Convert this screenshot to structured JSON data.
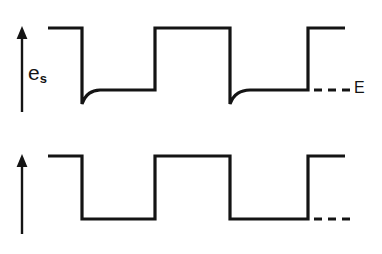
{
  "figure": {
    "type": "waveform-diagram",
    "width": 382,
    "height": 254,
    "background_color": "#ffffff",
    "stroke_color": "#141414"
  },
  "panels": [
    {
      "id": "top",
      "signal_name": "e_s",
      "label_base": "e",
      "label_subscript": "s",
      "label_style": "upright",
      "reference_label": "E",
      "reference_dash_style": "dashed",
      "waveform_kind": "ac-coupled-square-with-exponential-recovery",
      "notes": "Square wave whose falling edges undershoot below the E reference level and then recover exponentially back toward E"
    },
    {
      "id": "bottom",
      "signal_name": "v_0",
      "label_base": "ᴠ",
      "label_subscript": "0",
      "label_style": "script-italic",
      "reference_label": "E",
      "reference_dash_style": "dashed",
      "waveform_kind": "ideal-square-wave",
      "notes": "Clean rectangular square wave with flat high and low levels"
    }
  ],
  "chart_data": {
    "type": "line",
    "title": "",
    "xlabel": "",
    "ylabel": "",
    "grid": false,
    "legend": false,
    "xlim": [
      0,
      382
    ],
    "series": [
      {
        "name": "e_s",
        "panel": "top",
        "ylabel": "e_s",
        "high_level": 28,
        "low_level": 90,
        "undershoot_level": 104,
        "reference_level_E": 90,
        "path": "M 48 28 L 82 28 L 82 104 C 86 93 92 90.5 100 90 L 155 90 L 155 28 L 230 28 L 230 104 C 234 93 241 90.5 250 90 L 308 90 L 308 28 L 345 28",
        "transitions": [
          {
            "x": 82,
            "type": "fall"
          },
          {
            "x": 155,
            "type": "rise"
          },
          {
            "x": 230,
            "type": "fall"
          },
          {
            "x": 308,
            "type": "rise"
          }
        ],
        "reference_dashes": [
          {
            "x1": 314,
            "x2": 322,
            "y": 90
          },
          {
            "x1": 328,
            "x2": 336,
            "y": 90
          },
          {
            "x1": 342,
            "x2": 350,
            "y": 90
          }
        ],
        "axis_arrow": {
          "x": 22,
          "y_top": 26,
          "y_bottom": 112
        }
      },
      {
        "name": "v_0",
        "panel": "bottom",
        "ylabel": "ᴠ_0",
        "high_level": 26,
        "low_level": 89,
        "reference_level_E": 89,
        "path": "M 48 26 L 82 26 L 82 89 L 155 89 L 155 26 L 230 26 L 230 89 L 308 89 L 308 26 L 345 26",
        "transitions": [
          {
            "x": 82,
            "type": "fall"
          },
          {
            "x": 155,
            "type": "rise"
          },
          {
            "x": 230,
            "type": "fall"
          },
          {
            "x": 308,
            "type": "rise"
          }
        ],
        "reference_dashes": [
          {
            "x1": 314,
            "x2": 322,
            "y": 89
          },
          {
            "x1": 328,
            "x2": 336,
            "y": 89
          },
          {
            "x1": 342,
            "x2": 350,
            "y": 89
          }
        ],
        "axis_arrow": {
          "x": 22,
          "y_top": 24,
          "y_bottom": 104
        }
      }
    ]
  }
}
